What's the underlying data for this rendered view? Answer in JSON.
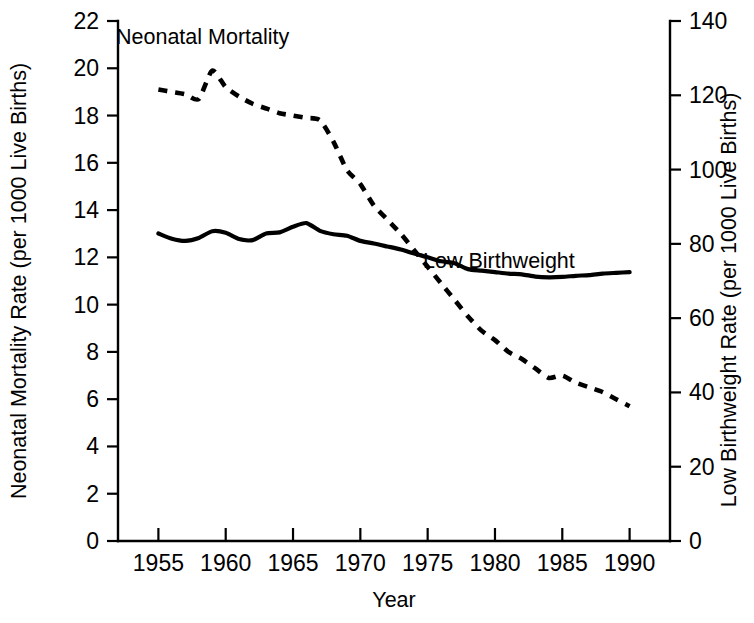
{
  "chart_data": {
    "type": "line",
    "title": "",
    "xlabel": "Year",
    "ylabel": "Neonatal Mortality Rate (per 1000 Live Births)",
    "y2label": "Low Birthweight Rate (per 1000 Live Births)",
    "xlim": [
      1952,
      1993
    ],
    "ylim": [
      0,
      22
    ],
    "y2lim": [
      0,
      140
    ],
    "grid": false,
    "legend_position": "inline-annotations",
    "xticks": [
      1955,
      1960,
      1965,
      1970,
      1975,
      1980,
      1985,
      1990
    ],
    "xticklabels": [
      "1955",
      "1960",
      "1965",
      "1970",
      "1975",
      "1980",
      "1985",
      "1990"
    ],
    "yticks": [
      0,
      2,
      4,
      6,
      8,
      10,
      12,
      14,
      16,
      18,
      20,
      22
    ],
    "yticklabels": [
      "0",
      "2",
      "4",
      "6",
      "8",
      "10",
      "12",
      "14",
      "16",
      "18",
      "20",
      "22"
    ],
    "y2ticks": [
      0,
      20,
      40,
      60,
      80,
      100,
      120,
      140
    ],
    "y2ticklabels": [
      "0",
      "20",
      "40",
      "60",
      "80",
      "100",
      "120",
      "140"
    ],
    "series": [
      {
        "name": "Neonatal Mortality",
        "axis": "left",
        "style": "dashed",
        "label_text": "Neonatal Mortality",
        "x": [
          1955,
          1956,
          1957,
          1958,
          1959,
          1960,
          1961,
          1962,
          1963,
          1964,
          1965,
          1966,
          1967,
          1968,
          1969,
          1970,
          1971,
          1972,
          1973,
          1974,
          1975,
          1976,
          1977,
          1978,
          1979,
          1980,
          1981,
          1982,
          1983,
          1984,
          1985,
          1986,
          1987,
          1988,
          1989,
          1990
        ],
        "values": [
          19.1,
          19.0,
          18.9,
          18.7,
          19.9,
          19.2,
          18.8,
          18.5,
          18.3,
          18.1,
          18.0,
          17.9,
          17.8,
          16.9,
          15.7,
          15.1,
          14.2,
          13.6,
          13.0,
          12.3,
          11.6,
          10.9,
          10.2,
          9.5,
          8.9,
          8.5,
          8.0,
          7.7,
          7.3,
          6.9,
          7.0,
          6.7,
          6.5,
          6.3,
          6.0,
          5.7
        ]
      },
      {
        "name": "Low Birthweight",
        "axis": "right",
        "style": "solid",
        "label_text": "Low Birthweight",
        "x": [
          1955,
          1956,
          1957,
          1958,
          1959,
          1960,
          1961,
          1962,
          1963,
          1964,
          1965,
          1966,
          1967,
          1968,
          1969,
          1970,
          1971,
          1972,
          1973,
          1974,
          1975,
          1976,
          1977,
          1978,
          1979,
          1980,
          1981,
          1982,
          1983,
          1984,
          1985,
          1986,
          1987,
          1988,
          1989,
          1990
        ],
        "values": [
          82.8,
          81.4,
          80.8,
          81.6,
          83.4,
          83.0,
          81.3,
          81.0,
          82.8,
          83.1,
          84.6,
          85.6,
          83.5,
          82.6,
          82.2,
          80.8,
          80.1,
          79.3,
          78.5,
          77.4,
          76.4,
          75.3,
          74.8,
          73.2,
          72.8,
          72.4,
          72.0,
          71.8,
          71.2,
          71.0,
          71.1,
          71.4,
          71.6,
          72.0,
          72.2,
          72.4
        ]
      }
    ],
    "annotations": [
      {
        "text": "Neonatal Mortality",
        "x_px": 116,
        "y_px": 44
      },
      {
        "text": "Low Birthweight",
        "x_px": 423,
        "y_px": 268
      }
    ]
  },
  "axis_titles": {
    "left": "Neonatal Mortality Rate (per 1000 Live Births)",
    "right": "Low Birthweight Rate (per 1000 Live Births)",
    "bottom": "Year"
  }
}
